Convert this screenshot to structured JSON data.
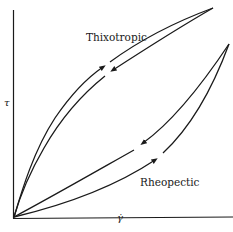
{
  "figure": {
    "type": "flow-curve-hysteresis-diagram",
    "axes": {
      "y_label": "τ",
      "x_label": "γ̇"
    },
    "curves": [
      {
        "name": "Thixotropic",
        "label": "Thixotropic",
        "description": "hysteresis loop above linear; up-curve higher than down-curve",
        "arrows": [
          "up on upper branch",
          "down on lower branch"
        ]
      },
      {
        "name": "Rheopectic",
        "label": "Rheopectic",
        "description": "hysteresis loop below linear; up-curve lower than down-curve",
        "arrows": [
          "up on lower branch",
          "down on upper branch"
        ]
      }
    ],
    "colors": {
      "line": "#1a1a1a",
      "background": "#ffffff"
    }
  }
}
